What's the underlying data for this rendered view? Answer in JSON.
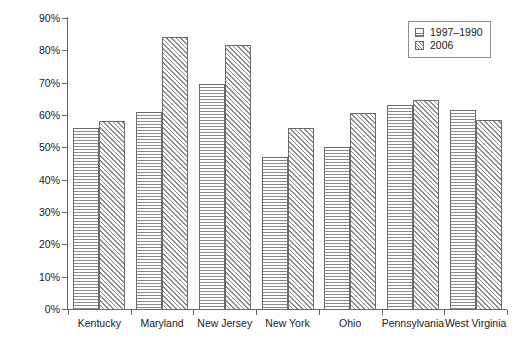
{
  "chart_data": {
    "type": "bar",
    "title": "",
    "xlabel": "",
    "ylabel": "Price ratio (industrial/residential)",
    "categories": [
      "Kentucky",
      "Maryland",
      "New Jersey",
      "New York",
      "Ohio",
      "Pennsylvania",
      "West Virginia"
    ],
    "series": [
      {
        "name": "1997–1990",
        "values": [
          56.0,
          61.0,
          69.5,
          47.0,
          50.0,
          63.0,
          61.5
        ]
      },
      {
        "name": "2006",
        "values": [
          58.0,
          84.0,
          81.5,
          56.0,
          60.5,
          64.5,
          58.5
        ]
      }
    ],
    "ylim": [
      0,
      90
    ],
    "ytick_values": [
      0,
      10,
      20,
      30,
      40,
      50,
      60,
      70,
      80,
      90
    ],
    "ytick_labels": [
      "0%",
      "10%",
      "20%",
      "30%",
      "40%",
      "50%",
      "60%",
      "70%",
      "80%",
      "90%"
    ],
    "grid": false,
    "legend_position": "top-right",
    "legend_entries": [
      "1997–1990",
      "2006"
    ],
    "value_unit": "%"
  },
  "colors": {
    "axis": "#666666",
    "bar_outline": "#6b6b6b",
    "hatch": "#8a8a8a",
    "background": "#ffffff",
    "text": "#1a1a1a"
  }
}
